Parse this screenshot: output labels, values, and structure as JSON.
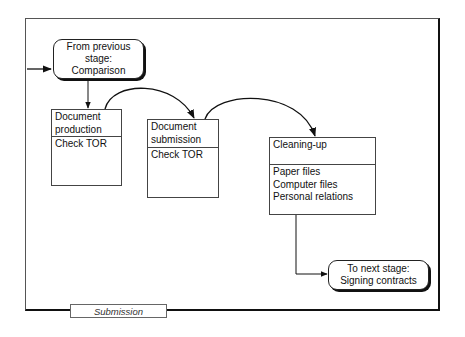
{
  "diagram": {
    "start_node": {
      "line1": "From previous",
      "line2": "stage:",
      "line3": "Comparison"
    },
    "processes": [
      {
        "title_line1": "Document",
        "title_line2": "production",
        "items": [
          "Check TOR"
        ]
      },
      {
        "title_line1": "Document",
        "title_line2": "submission",
        "items": [
          "Check TOR"
        ]
      },
      {
        "title_line1": "Cleaning-up",
        "title_line2": "",
        "items": [
          "Paper files",
          "Computer files",
          "Personal relations"
        ]
      }
    ],
    "end_node": {
      "line1": "To next stage:",
      "line2": "Signing contracts"
    },
    "stage_label": "Submission"
  }
}
